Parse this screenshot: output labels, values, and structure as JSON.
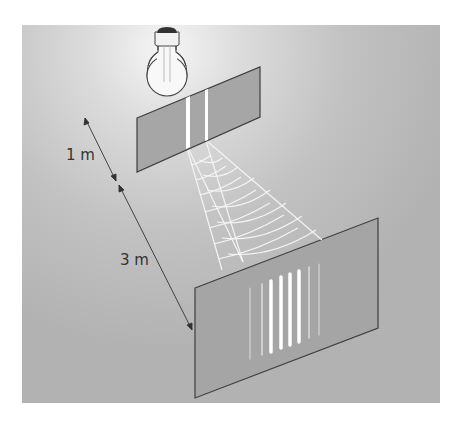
{
  "diagram": {
    "labels": {
      "distance_source_to_slits": "1 m",
      "distance_slits_to_screen": "3 m"
    },
    "elements": {
      "light_source": "light-bulb",
      "barrier": "double-slit-panel",
      "screen": "interference-screen",
      "waves": "wavefront-fan"
    },
    "fringes": {
      "bright_count": 4,
      "faint_count": 4
    },
    "colors": {
      "background_panel": "#b9b9b9",
      "background_highlight": "#f2f2f2",
      "plate_fill": "#a4a4a4",
      "plate_edge": "#4a4a4a",
      "slit": "#ffffff",
      "wave_lines": "#f4f4f4",
      "text": "#333333"
    }
  }
}
